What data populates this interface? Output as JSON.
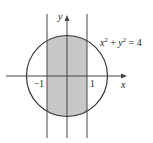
{
  "diagram": {
    "equation": {
      "base_x": "x",
      "sup_x": "2",
      "plus": " + ",
      "base_y": "y",
      "sup_y": "2",
      "rhs": " = 4"
    },
    "axis_labels": {
      "x": "x",
      "y": "y"
    },
    "tick_labels": {
      "neg_one": "−1",
      "one": "1"
    },
    "circle": {
      "center": [
        0,
        0
      ],
      "radius": 2
    },
    "vertical_lines": [
      -1,
      1
    ],
    "shaded_region": "circle interior between x = -1 and x = 1",
    "colors": {
      "shade": "#c8c8c8",
      "stroke": "#333333"
    }
  }
}
